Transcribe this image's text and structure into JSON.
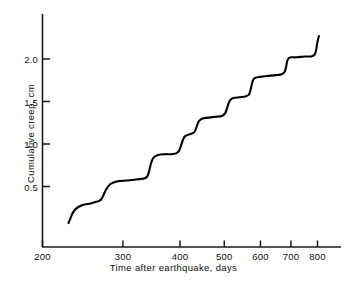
{
  "chart_data": {
    "type": "line",
    "title": "",
    "xlabel": "Time after earthquake, days",
    "ylabel": "Cumulative creep, cm",
    "xscale": "log",
    "yscale": "linear",
    "xlim": [
      200,
      860
    ],
    "ylim": [
      0,
      2.35
    ],
    "grid": false,
    "legend": null,
    "xticks": [
      200,
      300,
      400,
      500,
      600,
      700,
      800
    ],
    "xtick_labels": [
      "200",
      "300",
      "400",
      "500",
      "600",
      "700",
      "800"
    ],
    "yticks": [
      0.5,
      1.0,
      1.5,
      2.0
    ],
    "ytick_labels": [
      "0.5",
      "1.0",
      "1.5",
      "2.0"
    ],
    "series": [
      {
        "name": "Cumulative creep",
        "color": "#000000",
        "x": [
          228,
          230,
          233,
          237,
          242,
          248,
          255,
          262,
          266,
          269,
          272,
          276,
          282,
          292,
          305,
          318,
          330,
          336,
          340,
          343,
          346,
          350,
          358,
          370,
          382,
          392,
          398,
          402,
          406,
          410,
          418,
          428,
          432,
          436,
          440,
          448,
          462,
          478,
          494,
          502,
          507,
          511,
          516,
          524,
          540,
          556,
          566,
          571,
          575,
          579,
          585,
          598,
          620,
          648,
          668,
          678,
          683,
          687,
          692,
          700,
          720,
          750,
          775,
          788,
          794,
          798,
          802,
          806
        ],
        "y": [
          0.07,
          0.12,
          0.19,
          0.24,
          0.27,
          0.29,
          0.3,
          0.32,
          0.33,
          0.35,
          0.4,
          0.47,
          0.53,
          0.56,
          0.57,
          0.58,
          0.59,
          0.6,
          0.63,
          0.7,
          0.78,
          0.84,
          0.87,
          0.88,
          0.88,
          0.89,
          0.92,
          0.98,
          1.05,
          1.09,
          1.11,
          1.13,
          1.16,
          1.22,
          1.27,
          1.3,
          1.31,
          1.32,
          1.33,
          1.36,
          1.42,
          1.48,
          1.52,
          1.54,
          1.55,
          1.56,
          1.58,
          1.64,
          1.71,
          1.76,
          1.78,
          1.79,
          1.8,
          1.81,
          1.82,
          1.85,
          1.91,
          1.98,
          2.01,
          2.02,
          2.02,
          2.03,
          2.03,
          2.05,
          2.1,
          2.17,
          2.23,
          2.27
        ]
      }
    ],
    "annotations": []
  },
  "axes": {
    "x_title": "Time after earthquake, days",
    "y_title": "Cumulative creep, cm",
    "x_tick_labels": [
      "200",
      "300",
      "400",
      "500",
      "600",
      "700",
      "800"
    ],
    "y_tick_labels": [
      "0.5",
      "1.0",
      "1.5",
      "2.0"
    ]
  },
  "style": {
    "line_color": "#1a1a1a",
    "axis_color": "#1a1a1a",
    "background": "#ffffff"
  }
}
